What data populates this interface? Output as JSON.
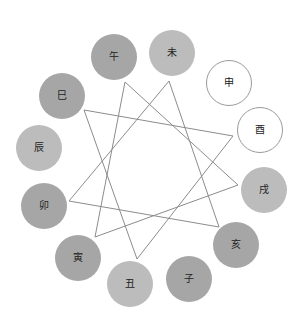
{
  "diagram": {
    "type": "earthly-branches-triad-star",
    "colors": {
      "dark": "#a6a6a6",
      "light": "#bcbcbc",
      "white": "#ffffff",
      "white_border": "#9a9a9a",
      "line": "#8c8c8c",
      "text": "#222222"
    },
    "branches": [
      {
        "label": "午",
        "cx": 114,
        "cy": 57,
        "fill": "dark"
      },
      {
        "label": "未",
        "cx": 172,
        "cy": 53,
        "fill": "light"
      },
      {
        "label": "申",
        "cx": 229,
        "cy": 83,
        "fill": "white"
      },
      {
        "label": "酉",
        "cx": 260,
        "cy": 130,
        "fill": "white"
      },
      {
        "label": "戌",
        "cx": 264,
        "cy": 190,
        "fill": "light"
      },
      {
        "label": "亥",
        "cx": 236,
        "cy": 245,
        "fill": "dark"
      },
      {
        "label": "子",
        "cx": 189,
        "cy": 279,
        "fill": "dark"
      },
      {
        "label": "丑",
        "cx": 130,
        "cy": 284,
        "fill": "light"
      },
      {
        "label": "寅",
        "cx": 78,
        "cy": 258,
        "fill": "dark"
      },
      {
        "label": "卯",
        "cx": 44,
        "cy": 206,
        "fill": "dark"
      },
      {
        "label": "辰",
        "cx": 39,
        "cy": 148,
        "fill": "light"
      },
      {
        "label": "巳",
        "cx": 62,
        "cy": 96,
        "fill": "dark"
      }
    ],
    "triangles": [
      {
        "name": "巳-酉-丑",
        "points": [
          [
            84,
            110
          ],
          [
            233,
            136
          ],
          [
            137,
            259
          ]
        ]
      },
      {
        "name": "午-戌-寅",
        "points": [
          [
            125,
            82
          ],
          [
            238,
            185
          ],
          [
            95,
            237
          ]
        ]
      },
      {
        "name": "未-亥-卯",
        "points": [
          [
            169,
            81
          ],
          [
            219,
            227
          ],
          [
            69,
            201
          ]
        ]
      }
    ]
  }
}
